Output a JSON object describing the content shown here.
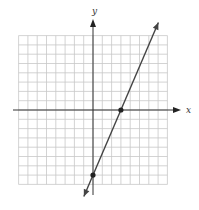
{
  "chart_data": {
    "type": "line",
    "title": "",
    "xlabel": "x",
    "ylabel": "y",
    "grid": true,
    "xlim": [
      -8,
      8
    ],
    "ylim": [
      -8,
      8
    ],
    "grid_step": 1,
    "tick_labels": false,
    "series": [
      {
        "name": "line",
        "slope": 2.333,
        "intercept": -7,
        "marked_points": [
          {
            "x": 0,
            "y": -7
          },
          {
            "x": 3,
            "y": 0
          }
        ],
        "arrows_both_ends": true
      }
    ]
  },
  "axes": {
    "x_label": "x",
    "y_label": "y"
  },
  "colors": {
    "grid": "#c8c8c8",
    "axis": "#333333",
    "line": "#444444",
    "point": "#222222"
  }
}
